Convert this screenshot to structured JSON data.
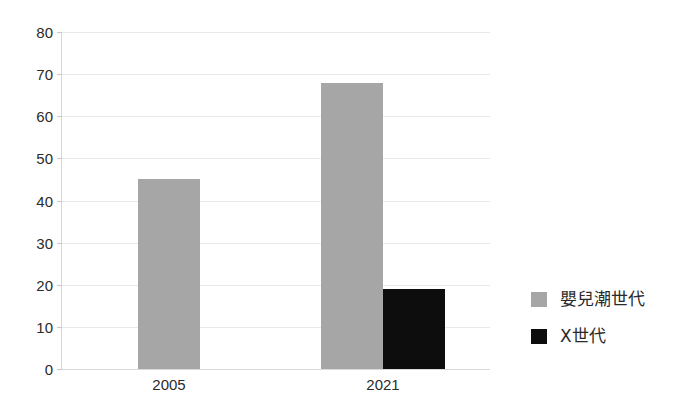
{
  "chart_data": {
    "type": "bar",
    "title": "",
    "subtitle": "",
    "xlabel": "",
    "ylabel": "",
    "categories": [
      "2005",
      "2021"
    ],
    "series": [
      {
        "name": "嬰兒潮世代",
        "color": "#a6a6a6",
        "values": [
          45,
          68
        ]
      },
      {
        "name": "X世代",
        "color": "#0d0d0d",
        "values": [
          null,
          19
        ]
      }
    ],
    "ylim": [
      0,
      80
    ],
    "y_ticks": [
      0,
      10,
      20,
      30,
      40,
      50,
      60,
      70,
      80
    ],
    "y_tick_labels": [
      "0",
      "10",
      "20",
      "30",
      "40",
      "50",
      "60",
      "70",
      "80"
    ],
    "grid": true,
    "grid_color": "#e9e9e9",
    "legend_position": "right",
    "background": "#ffffff",
    "axis_color": "#d6d6d6",
    "text_color": "#2b2b2b"
  },
  "legend": {
    "items": [
      {
        "label": "嬰兒潮世代",
        "color": "#a6a6a6"
      },
      {
        "label": "X世代",
        "color": "#0d0d0d"
      }
    ]
  }
}
